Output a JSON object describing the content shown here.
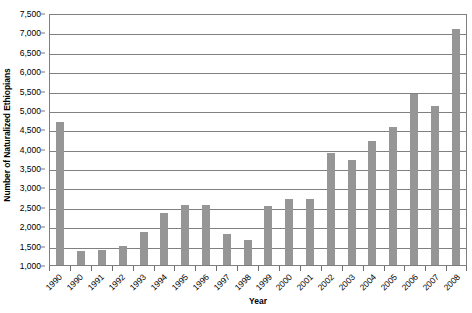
{
  "chart_data": {
    "type": "bar",
    "title": "",
    "xlabel": "Year",
    "ylabel": "Number of Naturalized Ethiopians",
    "categories": [
      "1990",
      "1990",
      "1991",
      "1992",
      "1993",
      "1994",
      "1995",
      "1996",
      "1997",
      "1998",
      "1999",
      "2000",
      "2001",
      "2002",
      "2003",
      "2004",
      "2005",
      "2006",
      "2007",
      "2008"
    ],
    "values": [
      4700,
      1350,
      1400,
      1500,
      1850,
      2350,
      2550,
      2550,
      1800,
      1650,
      2530,
      2700,
      2700,
      3880,
      3720,
      4200,
      4570,
      5400,
      5100,
      7100
    ],
    "ylim": [
      1000,
      7500
    ],
    "ytick_step": 500,
    "ytick_labels": [
      "7,500",
      "7,000",
      "6,500",
      "6,000",
      "5,500",
      "5,000",
      "4,500",
      "4,000",
      "3,500",
      "3,000",
      "2,500",
      "2,000",
      "1,500",
      "1,000"
    ],
    "ytick_values": [
      7500,
      7000,
      6500,
      6000,
      5500,
      5000,
      4500,
      4000,
      3500,
      3000,
      2500,
      2000,
      1500,
      1000
    ],
    "grid": true,
    "legend": "none",
    "legend_position": "none",
    "bar_color": "#969696",
    "gridline_color": "#808080",
    "plot_border_color": "#7f7f7f",
    "background_color": "#ffffff",
    "series": [
      {
        "name": "Number of Naturalized Ethiopians",
        "values": [
          4700,
          1350,
          1400,
          1500,
          1850,
          2350,
          2550,
          2550,
          1800,
          1650,
          2530,
          2700,
          2700,
          3880,
          3720,
          4200,
          4570,
          5400,
          5100,
          7100
        ]
      }
    ]
  },
  "axes": {
    "y_title": "Number of Naturalized Ethiopians",
    "x_title": "Year"
  }
}
